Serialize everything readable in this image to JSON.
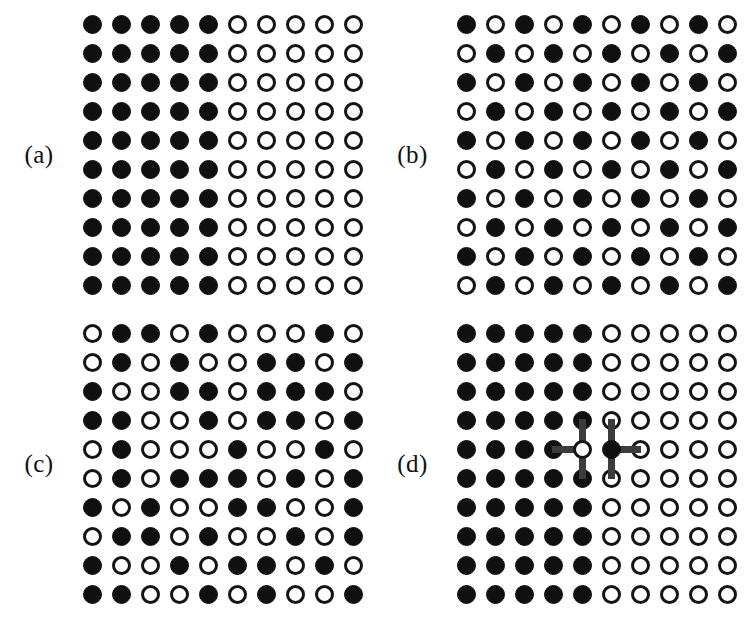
{
  "figure": {
    "background_color": "#ffffff",
    "filled_color": "#101010",
    "open_color": "#ffffff",
    "outline_color": "#141414",
    "bond_color": "#3c3c3c",
    "grid_rows": 10,
    "grid_cols": 10,
    "site_diameter_px": 19,
    "site_pitch_px": 29,
    "legend": {
      "filled": "occupied / spin-up site",
      "open": "vacant / spin-down site",
      "bond": "exchange bond between swapped pair"
    }
  },
  "panels": [
    {
      "id": "a",
      "label": "(a)",
      "name": "panel-a-phase-separated",
      "description": "Fully phase-separated configuration: left half filled, right half empty",
      "grid": [
        [
          1,
          1,
          1,
          1,
          1,
          0,
          0,
          0,
          0,
          0
        ],
        [
          1,
          1,
          1,
          1,
          1,
          0,
          0,
          0,
          0,
          0
        ],
        [
          1,
          1,
          1,
          1,
          1,
          0,
          0,
          0,
          0,
          0
        ],
        [
          1,
          1,
          1,
          1,
          1,
          0,
          0,
          0,
          0,
          0
        ],
        [
          1,
          1,
          1,
          1,
          1,
          0,
          0,
          0,
          0,
          0
        ],
        [
          1,
          1,
          1,
          1,
          1,
          0,
          0,
          0,
          0,
          0
        ],
        [
          1,
          1,
          1,
          1,
          1,
          0,
          0,
          0,
          0,
          0
        ],
        [
          1,
          1,
          1,
          1,
          1,
          0,
          0,
          0,
          0,
          0
        ],
        [
          1,
          1,
          1,
          1,
          1,
          0,
          0,
          0,
          0,
          0
        ],
        [
          1,
          1,
          1,
          1,
          1,
          0,
          0,
          0,
          0,
          0
        ]
      ],
      "bonds": []
    },
    {
      "id": "b",
      "label": "(b)",
      "name": "panel-b-checkerboard",
      "description": "Perfect checkerboard (antiferromagnetic / ordered) configuration",
      "grid": [
        [
          1,
          0,
          1,
          0,
          1,
          0,
          1,
          0,
          1,
          0
        ],
        [
          0,
          1,
          0,
          1,
          0,
          1,
          0,
          1,
          0,
          1
        ],
        [
          1,
          0,
          1,
          0,
          1,
          0,
          1,
          0,
          1,
          0
        ],
        [
          0,
          1,
          0,
          1,
          0,
          1,
          0,
          1,
          0,
          1
        ],
        [
          1,
          0,
          1,
          0,
          1,
          0,
          1,
          0,
          1,
          0
        ],
        [
          0,
          1,
          0,
          1,
          0,
          1,
          0,
          1,
          0,
          1
        ],
        [
          1,
          0,
          1,
          0,
          1,
          0,
          1,
          0,
          1,
          0
        ],
        [
          0,
          1,
          0,
          1,
          0,
          1,
          0,
          1,
          0,
          1
        ],
        [
          1,
          0,
          1,
          0,
          1,
          0,
          1,
          0,
          1,
          0
        ],
        [
          0,
          1,
          0,
          1,
          0,
          1,
          0,
          1,
          0,
          1
        ]
      ],
      "bonds": []
    },
    {
      "id": "c",
      "label": "(c)",
      "name": "panel-c-random",
      "description": "Random / disordered configuration",
      "grid": [
        [
          0,
          1,
          1,
          0,
          1,
          0,
          0,
          0,
          1,
          0
        ],
        [
          0,
          1,
          0,
          1,
          0,
          0,
          1,
          1,
          0,
          1
        ],
        [
          1,
          0,
          0,
          1,
          1,
          0,
          1,
          1,
          1,
          0
        ],
        [
          1,
          1,
          0,
          0,
          1,
          0,
          1,
          1,
          0,
          1
        ],
        [
          0,
          1,
          0,
          0,
          0,
          1,
          0,
          0,
          1,
          0
        ],
        [
          0,
          1,
          0,
          1,
          1,
          1,
          0,
          1,
          0,
          1
        ],
        [
          1,
          0,
          1,
          0,
          0,
          1,
          1,
          0,
          0,
          1
        ],
        [
          0,
          1,
          1,
          0,
          1,
          0,
          0,
          1,
          0,
          1
        ],
        [
          1,
          0,
          0,
          1,
          0,
          1,
          1,
          0,
          1,
          0
        ],
        [
          1,
          1,
          0,
          0,
          1,
          0,
          1,
          0,
          0,
          1
        ]
      ],
      "bonds": []
    },
    {
      "id": "d",
      "label": "(d)",
      "name": "panel-d-exchange-move",
      "description": "Phase-separated configuration with a single exchanged nearest-neighbour pair across the interface, bonds marked",
      "grid": [
        [
          1,
          1,
          1,
          1,
          1,
          0,
          0,
          0,
          0,
          0
        ],
        [
          1,
          1,
          1,
          1,
          1,
          0,
          0,
          0,
          0,
          0
        ],
        [
          1,
          1,
          1,
          1,
          1,
          0,
          0,
          0,
          0,
          0
        ],
        [
          1,
          1,
          1,
          1,
          1,
          0,
          0,
          0,
          0,
          0
        ],
        [
          1,
          1,
          1,
          1,
          0,
          1,
          0,
          0,
          0,
          0
        ],
        [
          1,
          1,
          1,
          1,
          1,
          0,
          0,
          0,
          0,
          0
        ],
        [
          1,
          1,
          1,
          1,
          1,
          0,
          0,
          0,
          0,
          0
        ],
        [
          1,
          1,
          1,
          1,
          1,
          0,
          0,
          0,
          0,
          0
        ],
        [
          1,
          1,
          1,
          1,
          1,
          0,
          0,
          0,
          0,
          0
        ],
        [
          1,
          1,
          1,
          1,
          1,
          0,
          0,
          0,
          0,
          0
        ]
      ],
      "bonds": [
        {
          "row": 4,
          "col": 4,
          "dirs": [
            "left",
            "up",
            "down"
          ]
        },
        {
          "row": 4,
          "col": 5,
          "dirs": [
            "right",
            "up",
            "down"
          ]
        }
      ]
    }
  ]
}
